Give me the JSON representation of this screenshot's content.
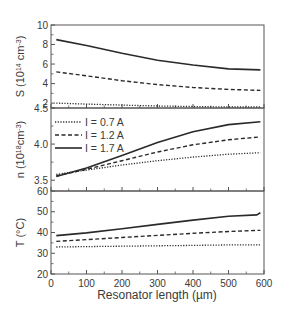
{
  "chart_data": {
    "type": "line",
    "layout": "three vertically stacked panels sharing x-axis",
    "xlabel": "Resonator length (µm)",
    "xlim": [
      0,
      600
    ],
    "xticks": [
      0,
      100,
      200,
      300,
      400,
      500,
      600
    ],
    "grid": false,
    "legend": {
      "position": "upper-left of middle panel",
      "entries": [
        {
          "label": "I = 0.7 A",
          "style": "dotted"
        },
        {
          "label": "I = 1.2 A",
          "style": "dashed"
        },
        {
          "label": "I = 1.7 A",
          "style": "solid"
        }
      ]
    },
    "panels": [
      {
        "id": "S",
        "ylabel": "S (10^14 cm^-3)",
        "ylabel_main": "S (10",
        "ylabel_sup1": "14",
        "ylabel_mid": " cm",
        "ylabel_sup2": "-3",
        "ylabel_end": ")",
        "ylim": [
          1.5,
          10
        ],
        "yticks": [
          2,
          4,
          6,
          8,
          10
        ],
        "x": [
          15,
          100,
          200,
          300,
          400,
          500,
          590
        ],
        "series": [
          {
            "name": "I = 0.7 A",
            "style": "dotted",
            "values": [
              2.0,
              1.9,
              1.8,
              1.7,
              1.65,
              1.6,
              1.6
            ]
          },
          {
            "name": "I = 1.2 A",
            "style": "dashed",
            "values": [
              5.2,
              4.8,
              4.3,
              3.9,
              3.6,
              3.4,
              3.3
            ]
          },
          {
            "name": "I = 1.7 A",
            "style": "solid",
            "values": [
              8.5,
              7.9,
              7.1,
              6.4,
              5.9,
              5.5,
              5.4
            ]
          }
        ]
      },
      {
        "id": "n",
        "ylabel": "n (10^18 cm^-3)",
        "ylabel_main": "n (10",
        "ylabel_sup1": "18",
        "ylabel_mid": "cm",
        "ylabel_sup2": "-3",
        "ylabel_end": ")",
        "ylim": [
          3.35,
          4.5
        ],
        "yticks": [
          3.5,
          4.0,
          4.5
        ],
        "ytick_labels": [
          "3.5",
          "4.0",
          "4.5"
        ],
        "x": [
          15,
          100,
          200,
          300,
          400,
          500,
          590
        ],
        "series": [
          {
            "name": "I = 0.7 A",
            "style": "dotted",
            "values": [
              3.58,
              3.64,
              3.71,
              3.77,
              3.82,
              3.86,
              3.88
            ]
          },
          {
            "name": "I = 1.2 A",
            "style": "dashed",
            "values": [
              3.56,
              3.65,
              3.77,
              3.89,
              3.99,
              4.06,
              4.1
            ]
          },
          {
            "name": "I = 1.7 A",
            "style": "solid",
            "values": [
              3.55,
              3.67,
              3.84,
              4.02,
              4.17,
              4.27,
              4.31
            ]
          }
        ]
      },
      {
        "id": "T",
        "ylabel": "T (°C)",
        "ylabel_main": "T (°C)",
        "ylim": [
          20,
          60
        ],
        "yticks": [
          20,
          30,
          40,
          50,
          60
        ],
        "x": [
          15,
          100,
          200,
          300,
          400,
          500,
          580,
          590
        ],
        "series": [
          {
            "name": "I = 0.7 A",
            "style": "dotted",
            "values": [
              33.0,
              33.2,
              33.4,
              33.6,
              33.8,
              34.0,
              34.0,
              34.0
            ]
          },
          {
            "name": "I = 1.2 A",
            "style": "dashed",
            "values": [
              35.7,
              36.6,
              37.6,
              38.6,
              39.6,
              40.5,
              41.0,
              41.0
            ]
          },
          {
            "name": "I = 1.7 A",
            "style": "solid",
            "values": [
              38.5,
              39.8,
              41.8,
              43.9,
              46.0,
              47.8,
              48.5,
              49.5
            ]
          }
        ]
      }
    ]
  },
  "colors": {
    "line": "#2a2a2a",
    "frame": "#555555",
    "text": "#3a3a3a",
    "background": "#ffffff"
  }
}
